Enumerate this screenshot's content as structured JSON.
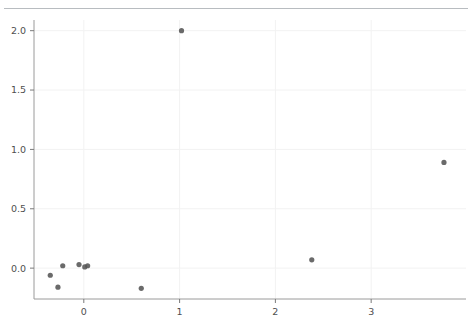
{
  "topbar": {
    "left_text": "···   ······· ··· ········",
    "right_text": "··"
  },
  "chart_data": {
    "type": "scatter",
    "title": "",
    "subtitle": "",
    "xlabel": "",
    "ylabel": "",
    "xlim": [
      -0.52,
      3.99
    ],
    "ylim": [
      -0.26,
      2.09
    ],
    "xticks": [
      0,
      1,
      2,
      3
    ],
    "xticklabels": [
      "0",
      "1",
      "2",
      "3"
    ],
    "yticks": [
      0.0,
      0.5,
      1.0,
      1.5,
      2.0
    ],
    "yticklabels": [
      "0.0",
      "0.5",
      "1.0",
      "1.5",
      "2.0"
    ],
    "grid": true,
    "legend": null,
    "marker": {
      "shape": "circle",
      "color": "#555555",
      "size": 5.2,
      "opacity": 0.88
    },
    "series": [
      {
        "name": "points",
        "points": [
          {
            "x": -0.35,
            "y": -0.06
          },
          {
            "x": -0.27,
            "y": -0.16
          },
          {
            "x": -0.22,
            "y": 0.02
          },
          {
            "x": -0.05,
            "y": 0.03
          },
          {
            "x": 0.01,
            "y": 0.01
          },
          {
            "x": 0.04,
            "y": 0.02
          },
          {
            "x": 0.6,
            "y": -0.17
          },
          {
            "x": 1.02,
            "y": 2.0
          },
          {
            "x": 2.38,
            "y": 0.07
          },
          {
            "x": 3.76,
            "y": 0.89
          }
        ]
      }
    ]
  }
}
